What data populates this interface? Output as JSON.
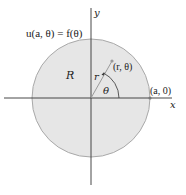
{
  "diagram": {
    "type": "polar-region",
    "colors": {
      "region_fill": "#e6e6e6",
      "circle_stroke": "#a9a9a9",
      "axis": "#333333",
      "radius_line": "#9a9a9a",
      "text": "#222222"
    },
    "boundary_condition": "u(a, θ) = f(θ)",
    "region_label": "R",
    "radius_label": "r",
    "angle_label": "θ",
    "point_label": "(r, θ)",
    "boundary_point_label": "(a, 0)",
    "x_axis_label": "x",
    "y_axis_label": "y"
  }
}
